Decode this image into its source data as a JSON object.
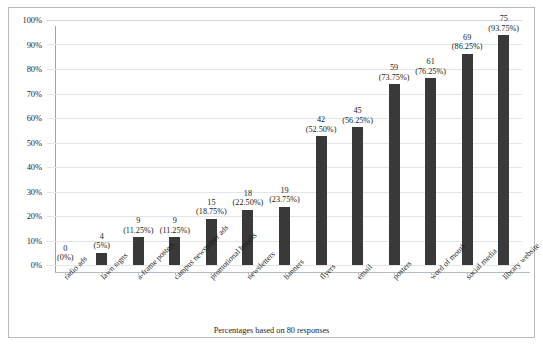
{
  "figure": {
    "caption": "Percentages based on 80 responses"
  },
  "chart_data": {
    "type": "bar",
    "title": "",
    "subtitle": "",
    "xlabel": "",
    "ylabel": "",
    "ylim": [
      0,
      100
    ],
    "ytick_labels": [
      "0%",
      "10%",
      "20%",
      "30%",
      "40%",
      "50%",
      "60%",
      "70%",
      "80%",
      "90%",
      "100%"
    ],
    "ytick_values": [
      0,
      10,
      20,
      30,
      40,
      50,
      60,
      70,
      80,
      90,
      100
    ],
    "grid": true,
    "legend": "none",
    "total_responses": 80,
    "bar_color": "#393939",
    "gridline_color": "#dfe6ee",
    "categories": [
      "radio ads",
      "lawn signs",
      "a-frame posters",
      "campus newspaper ads",
      "promotional booths",
      "newsletters",
      "banners",
      "flyers",
      "email",
      "posters",
      "word of mouth",
      "social media",
      "library website"
    ],
    "counts": [
      0,
      4,
      9,
      9,
      15,
      18,
      19,
      42,
      45,
      59,
      61,
      69,
      75
    ],
    "values": [
      0,
      5,
      11.25,
      11.25,
      18.75,
      22.5,
      23.75,
      52.5,
      56.25,
      73.75,
      76.25,
      86.25,
      93.75
    ],
    "data_labels": [
      {
        "count": "0",
        "percent": "(0%)"
      },
      {
        "count": "4",
        "percent": "(5%)"
      },
      {
        "count": "9",
        "percent": "(11.25%)"
      },
      {
        "count": "9",
        "percent": "(11.25%)"
      },
      {
        "count": "15",
        "percent": "(18.75%)"
      },
      {
        "count": "18",
        "percent": "(22.50%)"
      },
      {
        "count": "19",
        "percent": "(23.75%)"
      },
      {
        "count": "42",
        "percent": "(52.50%)"
      },
      {
        "count": "45",
        "percent": "(56.25%)"
      },
      {
        "count": "59",
        "percent": "(73.75%)"
      },
      {
        "count": "61",
        "percent": "(76.25%)"
      },
      {
        "count": "69",
        "percent": "(86.25%)"
      },
      {
        "count": "75",
        "percent": "(93.75%)"
      }
    ]
  }
}
